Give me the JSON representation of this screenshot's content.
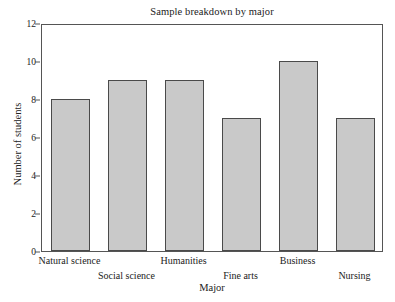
{
  "chart_data": {
    "type": "bar",
    "title": "Sample breakdown by major",
    "xlabel": "Major",
    "ylabel": "Number of students",
    "categories": [
      "Natural science",
      "Social science",
      "Humanities",
      "Fine arts",
      "Business",
      "Nursing"
    ],
    "values": [
      8,
      9,
      9,
      7,
      10,
      7
    ],
    "ylim": [
      0,
      12
    ],
    "yticks": [
      0,
      2,
      4,
      6,
      8,
      10,
      12
    ],
    "ytick_labels": [
      "0",
      "2",
      "4",
      "6",
      "8",
      "10",
      "12"
    ],
    "grid": false,
    "legend": null,
    "bar_fill_color": "#c9c9c9",
    "bar_edge_color": "#4a4a4a",
    "frame_color": "#555555",
    "background_color": "#ffffff",
    "label_rows": [
      0,
      1,
      0,
      1,
      0,
      1
    ]
  }
}
